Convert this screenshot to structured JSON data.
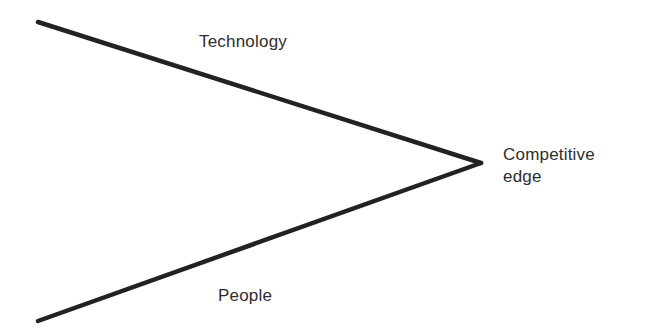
{
  "diagram": {
    "type": "converging-lines",
    "colors": {
      "line": "#222222",
      "text": "#2e2e2e",
      "background": "#ffffff"
    },
    "lines": [
      {
        "name": "Technology",
        "from": [
          38,
          22
        ],
        "to": [
          481,
          163
        ]
      },
      {
        "name": "People",
        "from": [
          38,
          321
        ],
        "to": [
          481,
          163
        ]
      }
    ],
    "labels": {
      "top": "Technology",
      "bottom": "People",
      "result_line1": "Competitive",
      "result_line2": "edge"
    }
  }
}
